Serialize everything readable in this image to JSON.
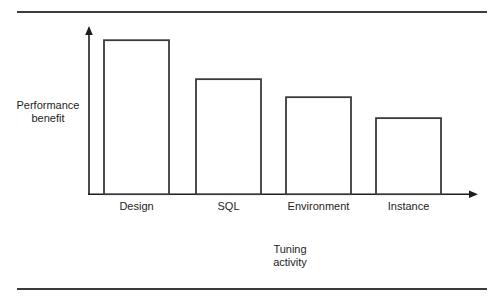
{
  "chart_data": {
    "type": "bar",
    "title": "",
    "subtitle": "",
    "categories": [
      "Design",
      "SQL",
      "Environment",
      "Instance"
    ],
    "values": [
      100,
      74.7,
      63.0,
      49.4
    ],
    "xlabel_lines": [
      "Tuning",
      "activity"
    ],
    "ylabel_lines": [
      "Performance",
      "benefit"
    ],
    "xlabel": "Tuning activity",
    "ylabel": "Performance benefit",
    "ylim": [
      0,
      110
    ],
    "grid": false,
    "legend": "none",
    "axis_tick_labels_y": [],
    "annotations": [],
    "style": {
      "bar_fill": "#ffffff",
      "bar_stroke": "#3a3a3a",
      "axis_color": "#1d1d1d",
      "rule_color": "#3b3b3b",
      "text_color": "#1d1d1d"
    }
  },
  "figure": {
    "top_rule": "horizontal-rule",
    "bottom_rule": "horizontal-rule"
  },
  "axes": {
    "y_arrow": "arrow-up",
    "x_arrow": "arrow-right"
  }
}
